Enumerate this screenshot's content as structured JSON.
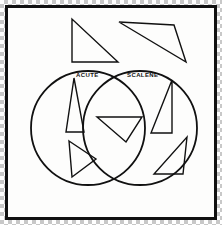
{
  "figure": {
    "kind": "venn-diagram",
    "title_visible": false,
    "frame": {
      "border_color": "#111111",
      "background_color": "#fdfdfc",
      "outer_background": "transparency-checkerboard"
    },
    "stroke_color": "#111111"
  },
  "venn": {
    "left_circle": {
      "label": "ACUTE",
      "cx": 88,
      "cy": 128,
      "r": 57,
      "label_x": 76,
      "label_y": 77
    },
    "right_circle": {
      "label": "SCALENE",
      "cx": 140,
      "cy": 128,
      "r": 57,
      "label_x": 127,
      "label_y": 77
    }
  },
  "shapes": [
    {
      "name": "right-triangle-top-left",
      "region": "outside",
      "points": "72,19 72,62 118,62"
    },
    {
      "name": "obtuse-triangle-top-right",
      "region": "outside",
      "points": "119,22 174,25 186,62"
    },
    {
      "name": "tall-acute-triangle",
      "region": "acute-only",
      "points": "74,78 84,132 66,132"
    },
    {
      "name": "right-pointing-triangle",
      "region": "acute-only",
      "points": "69,141 96,159 72,177"
    },
    {
      "name": "intersection-triangle",
      "region": "both",
      "points": "97,117 142,117 126,142"
    },
    {
      "name": "right-triangle-scalene",
      "region": "scalene-only",
      "points": "172,80 172,133 151,133"
    },
    {
      "name": "thin-triangle-scalene",
      "region": "scalene-only",
      "points": "187,137 183,174 154,174"
    }
  ]
}
